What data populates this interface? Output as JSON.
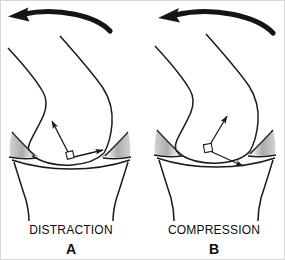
{
  "figure": {
    "background_color": "#ffffff",
    "ink_color": "#1a1a1a",
    "meniscus_shade_color": "#b5b5b5",
    "width": 285,
    "height": 260
  },
  "panels": [
    {
      "id": "A",
      "title": "DISTRACTION",
      "letter": "A",
      "motion_arrow": {
        "name": "curved-motion-arrow",
        "direction": "leftward-curved",
        "description": "thick curved arrow sweeping right-to-left above the knee"
      },
      "force_arrows": [
        {
          "name": "force-arrow-up-left",
          "direction": "up-left"
        },
        {
          "name": "force-arrow-right",
          "direction": "right"
        }
      ],
      "right_angle_marker": true,
      "anatomy": [
        "femur",
        "tibia",
        "medial-meniscus",
        "lateral-meniscus"
      ]
    },
    {
      "id": "B",
      "title": "COMPRESSION",
      "letter": "B",
      "motion_arrow": {
        "name": "curved-motion-arrow",
        "direction": "leftward-curved",
        "description": "thick curved arrow sweeping right-to-left above the knee"
      },
      "force_arrows": [
        {
          "name": "force-arrow-up-right",
          "direction": "up-right"
        },
        {
          "name": "force-arrow-down-right",
          "direction": "down-right"
        }
      ],
      "right_angle_marker": true,
      "anatomy": [
        "femur",
        "tibia",
        "medial-meniscus",
        "lateral-meniscus"
      ]
    }
  ]
}
